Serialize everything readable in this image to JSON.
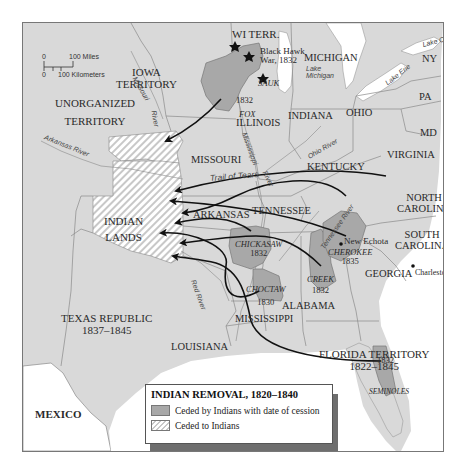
{
  "map": {
    "title": "INDIAN REMOVAL, 1820–1840",
    "colors": {
      "land": "#d9d9d9",
      "water": "#ffffff",
      "ceded_by_indians": "#a8a8a8",
      "ceded_to_indians_stripe": "#c8c8c8",
      "route": "#111111",
      "border": "#8a8a8a"
    },
    "scale": {
      "miles_zero": "0",
      "miles_label": "100 Miles",
      "km_zero": "0",
      "km_label": "100 Kilometers"
    },
    "regions": {
      "unorganized": [
        "UNORGANIZED",
        "TERRITORY"
      ],
      "iowa": [
        "IOWA",
        "TERRITORY"
      ],
      "wi": "WI TERR.",
      "indian_lands": [
        "INDIAN",
        "LANDS"
      ],
      "texas": [
        "TEXAS REPUBLIC",
        "1837–1845"
      ],
      "florida": [
        "FLORIDA TERRITORY",
        "1822–1845"
      ],
      "mexico": "MEXICO"
    },
    "states": {
      "michigan": "MICHIGAN",
      "ny": "NY",
      "pa": "PA",
      "md": "MD",
      "ohio": "OHIO",
      "indiana": "INDIANA",
      "illinois": "ILLINOIS",
      "missouri": "MISSOURI",
      "kentucky": "KENTUCKY",
      "virginia": "VIRGINIA",
      "north_carolina": [
        "NORTH",
        "CAROLINA"
      ],
      "south_carolina": [
        "SOUTH",
        "CAROLINA"
      ],
      "tennessee": "TENNESSEE",
      "arkansas": "ARKANSAS",
      "georgia": "GEORGIA",
      "alabama": "ALABAMA",
      "mississippi": "MISSISSIPPI",
      "louisiana": "LOUISIANA"
    },
    "water": {
      "lake_ontario": "Lake Ontario",
      "lake_erie": "Lake Erie",
      "lake_michigan": [
        "Lake",
        "Michigan"
      ],
      "missouri_river": [
        "Missouri",
        "River"
      ],
      "mississippi_river": [
        "Mississippi",
        "River"
      ],
      "arkansas_river": "Arkansas River",
      "ohio_river": "Ohio River",
      "tennessee_river": "Tennessee River",
      "red_river": "Red River"
    },
    "tribes": [
      {
        "name": "SAUK",
        "year": ""
      },
      {
        "name": "FOX",
        "year": "1832"
      },
      {
        "name": "CHICKASAW",
        "year": "1832"
      },
      {
        "name": "CHOCTAW",
        "year": "1830"
      },
      {
        "name": "CREEK",
        "year": "1832"
      },
      {
        "name": "CHEROKEE",
        "year": "1835"
      },
      {
        "name": "SEMINOLES",
        "year": "1832"
      }
    ],
    "annotations": {
      "black_hawk": [
        "Black Hawk",
        "War, 1832"
      ],
      "trail_of_tears": "Trail of Tears",
      "new_echota": "New Echota",
      "charleston": "Charleston"
    },
    "legend": {
      "items": [
        {
          "label": "Ceded by Indians with date of cession",
          "swatch": "solid"
        },
        {
          "label": "Ceded to Indians",
          "swatch": "hatched"
        }
      ]
    }
  }
}
